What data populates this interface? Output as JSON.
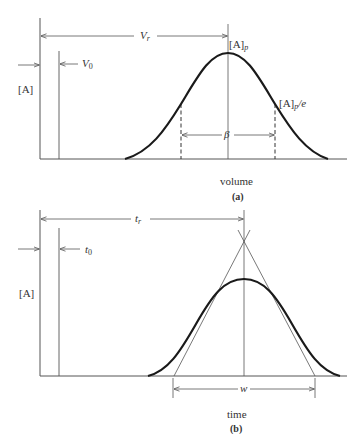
{
  "panel_a": {
    "retention_label": "V",
    "retention_sub": "r",
    "dead_label": "V",
    "dead_sub": "0",
    "y_label": "[A]",
    "peak_label": "[A]",
    "peak_sub": "p",
    "peak_e_label": "[A]",
    "peak_e_sub": "p",
    "peak_e_suffix": "/e",
    "width_label": "β",
    "x_label": "volume",
    "caption": "(a)"
  },
  "panel_b": {
    "retention_label": "t",
    "retention_sub": "r",
    "dead_label": "t",
    "dead_sub": "0",
    "y_label": "[A]",
    "width_label": "w",
    "x_label": "time",
    "caption": "(b)"
  },
  "colors": {
    "curve": "#1a1a1a",
    "line": "#555555",
    "text": "#333333"
  }
}
